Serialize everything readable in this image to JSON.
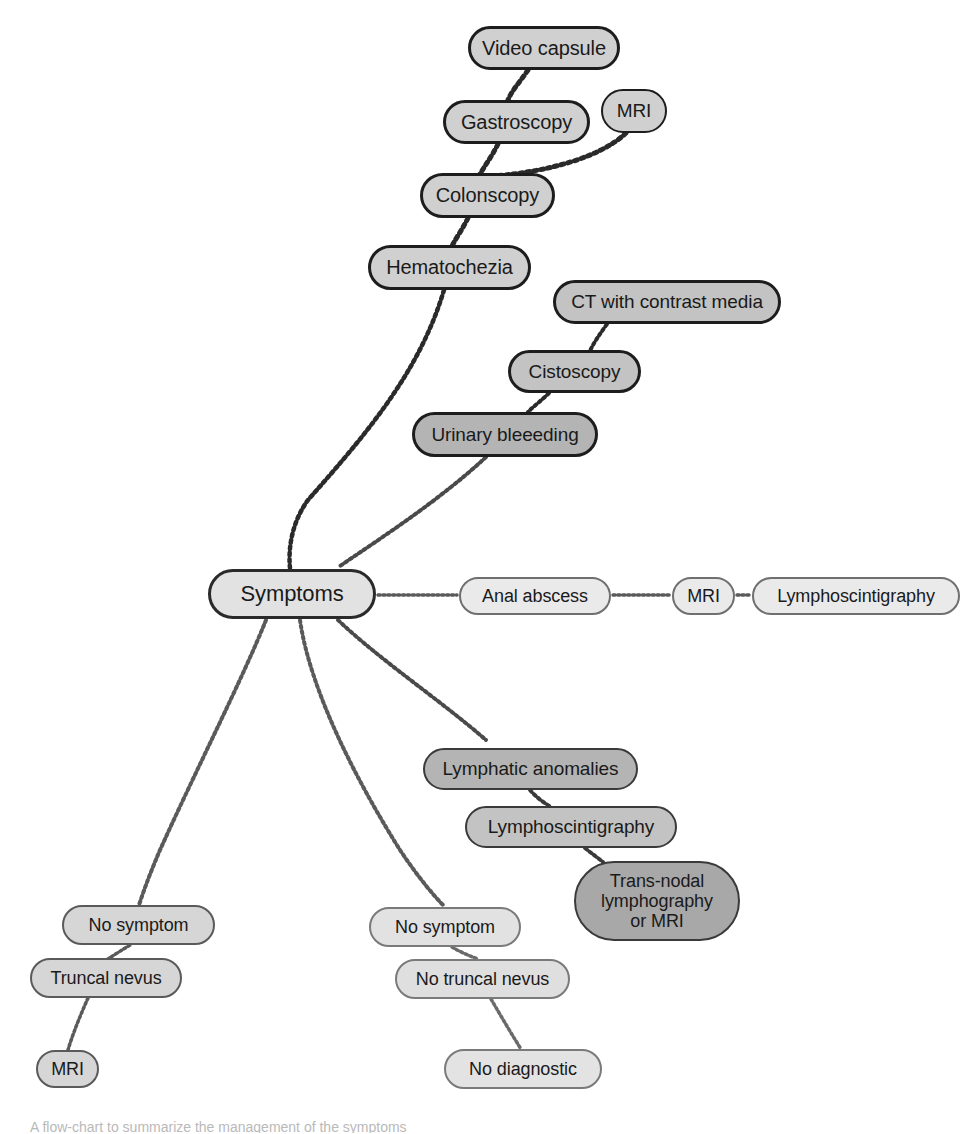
{
  "figure": {
    "type": "flow-chart",
    "background": "#ffffff",
    "caption_partial": "A flow-chart to summarize the management of the symptoms",
    "palette": {
      "fill_light": "#e2e2e2",
      "fill_mid": "#d0d0d0",
      "fill_dark": "#b4b4b4",
      "fill_darkest": "#a8a8a8",
      "border_thin": "#8d8d8d",
      "border_thick": "#1d1d1d",
      "text": "#1a1a1a",
      "edge": "#4a4a4a"
    }
  },
  "nodes": [
    {
      "id": "video_capsule",
      "label": "Video capsule",
      "x": 468,
      "y": 26,
      "w": 152,
      "h": 44,
      "fill": "#d0d0d0",
      "border": "#1d1d1d",
      "bw": 3,
      "fs": 20
    },
    {
      "id": "gastroscopy",
      "label": "Gastroscopy",
      "x": 443,
      "y": 100,
      "w": 147,
      "h": 44,
      "fill": "#d0d0d0",
      "border": "#1d1d1d",
      "bw": 3,
      "fs": 20
    },
    {
      "id": "mri_upper",
      "label": "MRI",
      "x": 601,
      "y": 89,
      "w": 66,
      "h": 44,
      "fill": "#d0d0d0",
      "border": "#1d1d1d",
      "bw": 2.5,
      "fs": 19
    },
    {
      "id": "colonscopy",
      "label": "Colonscopy",
      "x": 420,
      "y": 173,
      "w": 135,
      "h": 45,
      "fill": "#d0d0d0",
      "border": "#1d1d1d",
      "bw": 3,
      "fs": 20
    },
    {
      "id": "hematochezia",
      "label": "Hematochezia",
      "x": 368,
      "y": 245,
      "w": 163,
      "h": 45,
      "fill": "#d0d0d0",
      "border": "#1d1d1d",
      "bw": 3,
      "fs": 20
    },
    {
      "id": "ct_contrast",
      "label": "CT with contrast media",
      "x": 553,
      "y": 280,
      "w": 228,
      "h": 44,
      "fill": "#c3c3c3",
      "border": "#1d1d1d",
      "bw": 3,
      "fs": 19
    },
    {
      "id": "cistoscopy",
      "label": "Cistoscopy",
      "x": 508,
      "y": 350,
      "w": 133,
      "h": 43,
      "fill": "#c3c3c3",
      "border": "#1d1d1d",
      "bw": 3,
      "fs": 19
    },
    {
      "id": "urinary_bleeding",
      "label": "Urinary bleeeding",
      "x": 412,
      "y": 412,
      "w": 186,
      "h": 45,
      "fill": "#b4b4b4",
      "border": "#1d1d1d",
      "bw": 3,
      "fs": 19
    },
    {
      "id": "symptoms",
      "label": "Symptoms",
      "x": 208,
      "y": 569,
      "w": 168,
      "h": 50,
      "fill": "#e2e2e2",
      "border": "#2a2a2a",
      "bw": 3,
      "fs": 22
    },
    {
      "id": "anal_abscess",
      "label": "Anal abscess",
      "x": 459,
      "y": 577,
      "w": 152,
      "h": 38,
      "fill": "#eaeaea",
      "border": "#6f6f6f",
      "bw": 2,
      "fs": 18
    },
    {
      "id": "mri_row",
      "label": "MRI",
      "x": 672,
      "y": 577,
      "w": 63,
      "h": 38,
      "fill": "#eaeaea",
      "border": "#6f6f6f",
      "bw": 2,
      "fs": 18
    },
    {
      "id": "lymphoscint_row",
      "label": "Lymphoscintigraphy",
      "x": 752,
      "y": 577,
      "w": 208,
      "h": 38,
      "fill": "#eaeaea",
      "border": "#6f6f6f",
      "bw": 2,
      "fs": 18
    },
    {
      "id": "lymphatic_anom",
      "label": "Lymphatic anomalies",
      "x": 423,
      "y": 748,
      "w": 215,
      "h": 42,
      "fill": "#b4b4b4",
      "border": "#3a3a3a",
      "bw": 2.5,
      "fs": 19
    },
    {
      "id": "lymphoscint_branch",
      "label": "Lymphoscintigraphy",
      "x": 465,
      "y": 806,
      "w": 212,
      "h": 42,
      "fill": "#c3c3c3",
      "border": "#3a3a3a",
      "bw": 2.5,
      "fs": 19
    },
    {
      "id": "trans_nodal",
      "label": "Trans-nodal\nlymphography\nor MRI",
      "x": 574,
      "y": 861,
      "w": 166,
      "h": 80,
      "fill": "#a8a8a8",
      "border": "#3a3a3a",
      "bw": 2.5,
      "fs": 18
    },
    {
      "id": "no_symptom_left",
      "label": "No symptom",
      "x": 62,
      "y": 905,
      "w": 153,
      "h": 40,
      "fill": "#d6d6d6",
      "border": "#5a5a5a",
      "bw": 2,
      "fs": 18
    },
    {
      "id": "truncal_nevus",
      "label": "Truncal nevus",
      "x": 30,
      "y": 958,
      "w": 152,
      "h": 40,
      "fill": "#d6d6d6",
      "border": "#5a5a5a",
      "bw": 2,
      "fs": 18
    },
    {
      "id": "mri_bottom",
      "label": "MRI",
      "x": 36,
      "y": 1050,
      "w": 63,
      "h": 38,
      "fill": "#d6d6d6",
      "border": "#5a5a5a",
      "bw": 2,
      "fs": 18
    },
    {
      "id": "no_symptom_right",
      "label": "No symptom",
      "x": 369,
      "y": 907,
      "w": 152,
      "h": 40,
      "fill": "#e2e2e2",
      "border": "#7a7a7a",
      "bw": 2,
      "fs": 18
    },
    {
      "id": "no_truncal_nevus",
      "label": "No truncal nevus",
      "x": 395,
      "y": 959,
      "w": 175,
      "h": 40,
      "fill": "#dfdfdf",
      "border": "#7a7a7a",
      "bw": 2,
      "fs": 18
    },
    {
      "id": "no_diagnostic",
      "label": "No diagnostic",
      "x": 444,
      "y": 1049,
      "w": 158,
      "h": 40,
      "fill": "#e3e3e3",
      "border": "#7a7a7a",
      "bw": 2,
      "fs": 18
    }
  ],
  "edges": [
    {
      "id": "e_videocapsule_gastroscopy",
      "from": "video_capsule",
      "to": "gastroscopy",
      "d": "M 528 70 C 520 82 512 90 508 100",
      "w": 5,
      "color": "#2a2a2a"
    },
    {
      "id": "e_gastroscopy_colonscopy",
      "from": "gastroscopy",
      "to": "colonscopy",
      "d": "M 498 144 C 492 156 486 164 480 174",
      "w": 5,
      "color": "#2a2a2a"
    },
    {
      "id": "e_mri_colonscopy",
      "from": "mri_upper",
      "to": "colonscopy",
      "d": "M 626 133 C 600 158 545 172 494 176",
      "w": 5,
      "color": "#2a2a2a"
    },
    {
      "id": "e_colonscopy_hematochezia",
      "from": "colonscopy",
      "to": "hematochezia",
      "d": "M 468 218 C 462 230 456 238 452 246",
      "w": 5,
      "color": "#2a2a2a"
    },
    {
      "id": "e_hematochezia_symptoms",
      "from": "hematochezia",
      "to": "symptoms",
      "d": "M 444 290 C 420 370 370 430 308 500 C 292 522 288 548 290 568",
      "w": 4.5,
      "color": "#2a2a2a"
    },
    {
      "id": "e_ct_cistoscopy",
      "from": "ct_contrast",
      "to": "cistoscopy",
      "d": "M 607 324 C 600 334 594 342 590 351",
      "w": 4,
      "color": "#2a2a2a"
    },
    {
      "id": "e_cistoscopy_urinary",
      "from": "cistoscopy",
      "to": "urinary_bleeding",
      "d": "M 549 393 C 542 400 534 406 528 412",
      "w": 4,
      "color": "#2a2a2a"
    },
    {
      "id": "e_urinary_symptoms",
      "from": "urinary_bleeding",
      "to": "symptoms",
      "d": "M 486 457 C 440 500 378 540 340 566",
      "w": 4,
      "color": "#4a4a4a"
    },
    {
      "id": "e_symptoms_anal",
      "from": "symptoms",
      "to": "anal_abscess",
      "d": "M 378 595 L 457 595",
      "w": 3.5,
      "color": "#5a5a5a"
    },
    {
      "id": "e_anal_mri",
      "from": "anal_abscess",
      "to": "mri_row",
      "d": "M 613 595 L 670 595",
      "w": 3.5,
      "color": "#5a5a5a"
    },
    {
      "id": "e_mri_lymphoscint",
      "from": "mri_row",
      "to": "lymphoscint_row",
      "d": "M 737 595 L 750 595",
      "w": 3.5,
      "color": "#5a5a5a"
    },
    {
      "id": "e_symptoms_nosymptomleft",
      "from": "symptoms",
      "to": "no_symptom_left",
      "d": "M 266 620 C 242 680 196 770 160 850 C 148 878 142 896 139 905",
      "w": 4,
      "color": "#5a5a5a"
    },
    {
      "id": "e_symptoms_nosymptomright",
      "from": "symptoms",
      "to": "no_symptom_right",
      "d": "M 300 620 C 310 690 356 780 400 850 C 420 880 436 898 444 906",
      "w": 4,
      "color": "#5a5a5a"
    },
    {
      "id": "e_symptoms_lymphatic",
      "from": "symptoms",
      "to": "lymphatic_anom",
      "d": "M 338 620 C 380 660 440 700 486 740",
      "w": 4,
      "color": "#4a4a4a"
    },
    {
      "id": "e_lymphatic_lymphoscint",
      "from": "lymphatic_anom",
      "to": "lymphoscint_branch",
      "d": "M 530 790 C 536 797 544 803 551 807",
      "w": 4,
      "color": "#3a3a3a"
    },
    {
      "id": "e_lymphoscint_transnodal",
      "from": "lymphoscint_branch",
      "to": "trans_nodal",
      "d": "M 585 848 C 591 853 598 858 603 862",
      "w": 4,
      "color": "#3a3a3a"
    },
    {
      "id": "e_nosymptomleft_truncal",
      "from": "no_symptom_left",
      "to": "truncal_nevus",
      "d": "M 130 945 C 122 950 114 955 108 959",
      "w": 3.5,
      "color": "#5a5a5a"
    },
    {
      "id": "e_truncal_mri",
      "from": "truncal_nevus",
      "to": "mri_bottom",
      "d": "M 88 998 C 80 1016 72 1036 68 1050",
      "w": 3.5,
      "color": "#5a5a5a"
    },
    {
      "id": "e_nosymptomright_notruncal",
      "from": "no_symptom_right",
      "to": "no_truncal_nevus",
      "d": "M 452 947 C 460 952 470 956 478 959",
      "w": 3.5,
      "color": "#6a6a6a"
    },
    {
      "id": "e_notruncal_nodiagnostic",
      "from": "no_truncal_nevus",
      "to": "no_diagnostic",
      "d": "M 491 999 C 502 1018 514 1038 521 1049",
      "w": 3.5,
      "color": "#6a6a6a"
    }
  ]
}
